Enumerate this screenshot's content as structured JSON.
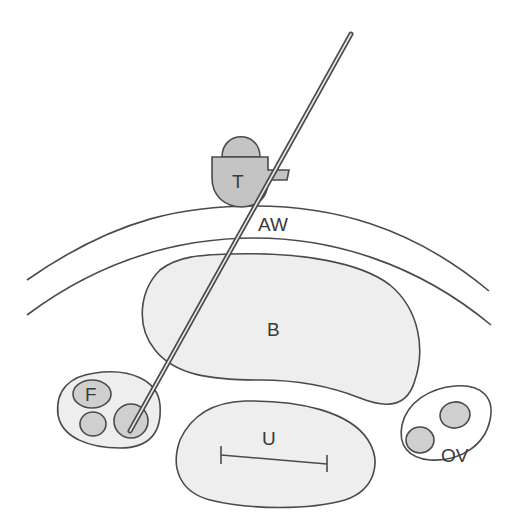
{
  "diagram": {
    "type": "anatomical-schematic",
    "colors": {
      "background": "#ffffff",
      "outline": "#4a4a4a",
      "organ_fill": "#eeeeee",
      "transducer_fill": "#c4c4c4",
      "follicle_fill": "#cfcfcf",
      "label": "#3a3a3a"
    },
    "labels": {
      "transducer": "T",
      "abdominal_wall": "AW",
      "bladder": "B",
      "follicles": "F",
      "uterus": "U",
      "ovary": "OV"
    },
    "elements": [
      {
        "id": "transducer",
        "label": "T"
      },
      {
        "id": "needle",
        "label": ""
      },
      {
        "id": "abdominal-wall",
        "label": "AW"
      },
      {
        "id": "bladder",
        "label": "B"
      },
      {
        "id": "left-ovary-follicles",
        "label": "F"
      },
      {
        "id": "uterus",
        "label": "U"
      },
      {
        "id": "right-ovary",
        "label": "OV"
      }
    ]
  }
}
